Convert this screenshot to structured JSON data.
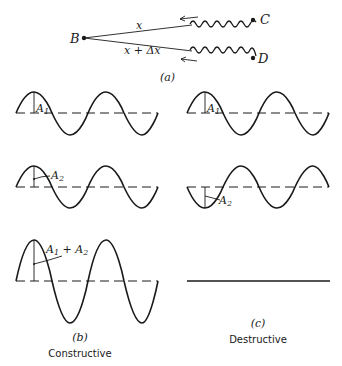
{
  "panel_a": {
    "label": "(a)",
    "point_b": "B",
    "point_c": "C",
    "point_d": "D",
    "path_upper": "x",
    "path_lower": "x + Δx"
  },
  "panel_b": {
    "label": "(b)",
    "caption": "Constructive",
    "wave1_amp": "A",
    "wave1_sub": "1",
    "wave2_amp": "A",
    "wave2_sub": "2",
    "sum_amp_a": "A",
    "sum_amp_sub1": "1",
    "sum_plus": " + A",
    "sum_amp_sub2": "2"
  },
  "panel_c": {
    "label": "(c)",
    "caption": "Destructive",
    "wave1_amp": "A",
    "wave1_sub": "1",
    "wave2_amp": "A",
    "wave2_sub": "2"
  },
  "colors": {
    "ink": "#1a1a1a",
    "background": "#ffffff"
  }
}
